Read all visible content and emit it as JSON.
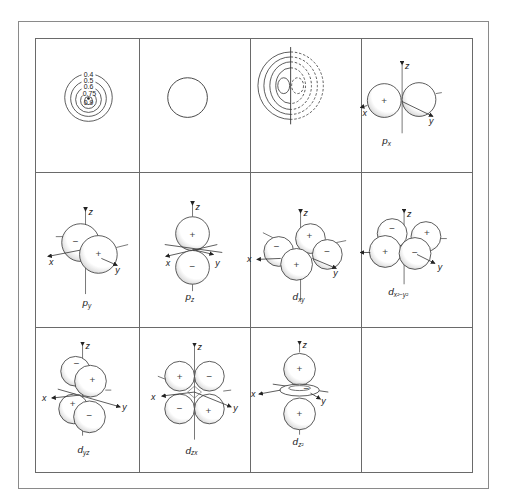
{
  "figure": {
    "grid": {
      "rows": 3,
      "cols": 4
    }
  },
  "cells": [
    {
      "id": "s-contour",
      "type": "contour-plot",
      "contour_labels": [
        "0.4",
        "0.5",
        "0.6",
        "0.75",
        "0.9"
      ]
    },
    {
      "id": "s-boundary",
      "type": "boundary-circle"
    },
    {
      "id": "p-contour",
      "type": "contour-plot-two-lobes",
      "solid_lobe": "positive",
      "dashed_lobe": "negative"
    },
    {
      "id": "px",
      "label": {
        "main": "p",
        "sub": "x"
      },
      "axes": {
        "x": "x",
        "y": "y",
        "z": "z"
      },
      "lobes": [
        "+",
        ""
      ]
    },
    {
      "id": "py",
      "label": {
        "main": "p",
        "sub": "y"
      },
      "axes": {
        "x": "x",
        "y": "y",
        "z": "z"
      },
      "lobes": [
        "−",
        "+"
      ]
    },
    {
      "id": "pz",
      "label": {
        "main": "p",
        "sub": "z"
      },
      "axes": {
        "x": "x",
        "y": "y",
        "z": "z"
      },
      "lobes": [
        "+",
        "−"
      ]
    },
    {
      "id": "dxy",
      "label": {
        "main": "d",
        "sub": "xy"
      },
      "axes": {
        "x": "x",
        "y": "y",
        "z": "z"
      },
      "lobes": [
        "−",
        "+",
        "+",
        "−"
      ]
    },
    {
      "id": "dx2y2",
      "label": {
        "main": "d",
        "sub": "x²−y²"
      },
      "axes": {
        "x": "x",
        "y": "y",
        "z": "z"
      },
      "lobes": [
        "−",
        "+",
        "+",
        "−"
      ]
    },
    {
      "id": "dyz",
      "label": {
        "main": "d",
        "sub": "yz"
      },
      "axes": {
        "x": "x",
        "y": "y",
        "z": "z"
      },
      "lobes": [
        "−",
        "+",
        "+",
        "−"
      ]
    },
    {
      "id": "dzx",
      "label": {
        "main": "d",
        "sub": "zx"
      },
      "axes": {
        "x": "x",
        "y": "y",
        "z": "z"
      },
      "lobes": [
        "+",
        "−",
        "−",
        "+"
      ]
    },
    {
      "id": "dz2",
      "label": {
        "main": "d",
        "sub": "z²"
      },
      "axes": {
        "x": "x",
        "y": "y",
        "z": "z"
      },
      "lobes": [
        "+",
        "−",
        "+"
      ]
    },
    {
      "id": "empty"
    }
  ],
  "colors": {
    "line": "#333333",
    "grid": "#6a6a6a",
    "frame": "#8a8a8a",
    "shade": "#c8c8c8"
  }
}
